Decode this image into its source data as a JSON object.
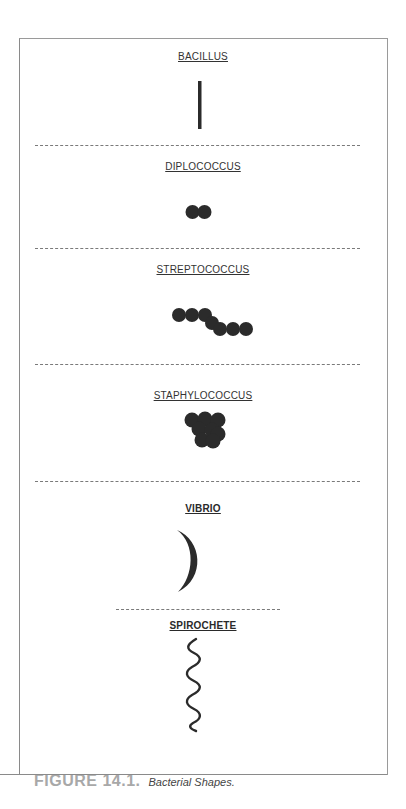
{
  "figure": {
    "number_label": "FIGURE 14.1.",
    "caption": "Bacterial Shapes."
  },
  "sections": [
    {
      "label": "BACILLUS",
      "shape": "rod"
    },
    {
      "label": "DIPLOCOCCUS",
      "shape": "pair-of-spheres"
    },
    {
      "label": "STREPTOCOCCUS",
      "shape": "chain-of-spheres"
    },
    {
      "label": "STAPHYLOCOCCUS",
      "shape": "cluster-of-spheres"
    },
    {
      "label": "VIBRIO",
      "shape": "comma-crescent"
    },
    {
      "label": "SPIROCHETE",
      "shape": "spiral"
    }
  ],
  "colors": {
    "shape_fill": "#2b2b2b",
    "frame": "#9a9a9a",
    "caption_figure": "#a8a8a8"
  }
}
